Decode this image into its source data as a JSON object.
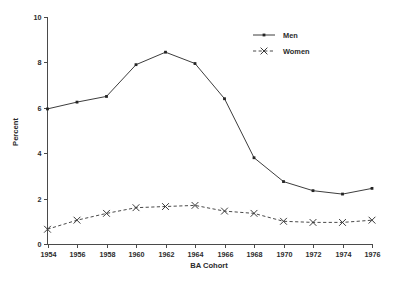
{
  "chart_data": {
    "type": "line",
    "title": "",
    "xlabel": "BA Cohort",
    "ylabel": "Percent",
    "categories": [
      "1954",
      "1956",
      "1958",
      "1960",
      "1962",
      "1964",
      "1966",
      "1968",
      "1970",
      "1972",
      "1974",
      "1976"
    ],
    "x": [
      1954,
      1956,
      1958,
      1960,
      1962,
      1964,
      1966,
      1968,
      1970,
      1972,
      1974,
      1976
    ],
    "series": [
      {
        "name": "Men",
        "marker": "dot",
        "linestyle": "solid",
        "color": "#3d3d3d",
        "values": [
          5.95,
          6.25,
          6.5,
          7.9,
          8.45,
          7.95,
          6.4,
          3.8,
          2.75,
          2.35,
          2.2,
          2.45
        ]
      },
      {
        "name": "Women",
        "marker": "x",
        "linestyle": "dashed",
        "color": "#4a4a4a",
        "values": [
          0.65,
          1.05,
          1.35,
          1.6,
          1.65,
          1.7,
          1.45,
          1.35,
          1.0,
          0.95,
          0.95,
          1.05
        ]
      }
    ],
    "xlim": [
      1954,
      1976
    ],
    "ylim": [
      0,
      10
    ],
    "ytick_labels": [
      "0",
      "2",
      "4",
      "6",
      "8",
      "10"
    ],
    "yticks": [
      0,
      2,
      4,
      6,
      8,
      10
    ],
    "grid": false,
    "legend_position": "top-right"
  },
  "legend": {
    "entries": [
      {
        "label": "Men"
      },
      {
        "label": "Women"
      }
    ]
  },
  "axes": {
    "x_title": "BA Cohort",
    "y_title": "Percent"
  }
}
